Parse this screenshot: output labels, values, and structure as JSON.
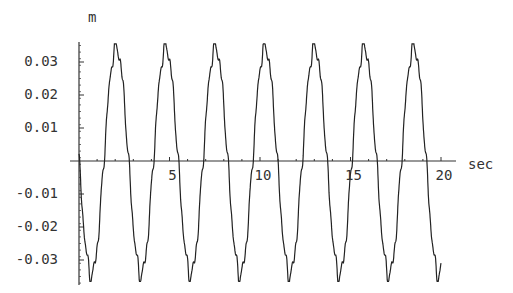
{
  "chart_data": {
    "type": "line",
    "title": "",
    "xlabel": "sec",
    "ylabel": "m",
    "xlim": [
      0,
      20.6
    ],
    "ylim": [
      -0.037,
      0.037
    ],
    "x_ticks": [
      5,
      10,
      15,
      20
    ],
    "x_tick_labels": [
      "5",
      "10",
      "15",
      "20"
    ],
    "y_ticks": [
      -0.03,
      -0.02,
      -0.01,
      0.01,
      0.02,
      0.03
    ],
    "y_tick_labels": [
      "-0.03",
      "-0.02",
      "-0.01",
      "0.01",
      "0.02",
      "0.03"
    ],
    "grid": false,
    "legend": null,
    "series": [
      {
        "name": "displacement",
        "description": "Oscillation of amplitude ~0.034 m with period ~2.74 s and small high-frequency ripple, starting at 0 and going negative first",
        "amplitude": 0.034,
        "period_sec": 2.74,
        "peaks_sec": [
          2.15,
          4.92,
          7.68,
          10.44,
          13.1,
          15.9,
          18.5
        ],
        "peak_values": [
          0.034,
          0.034,
          0.035,
          0.034,
          0.034,
          0.034,
          0.034
        ],
        "troughs_sec": [
          0.66,
          3.49,
          6.22,
          8.95,
          11.66,
          14.3,
          16.9,
          19.75
        ],
        "trough_values": [
          -0.035,
          -0.036,
          -0.035,
          -0.036,
          -0.035,
          -0.036,
          -0.036,
          -0.035
        ],
        "x_end_sec": 20.0
      }
    ]
  },
  "axes": {
    "y_label": "m",
    "x_label": "sec"
  }
}
